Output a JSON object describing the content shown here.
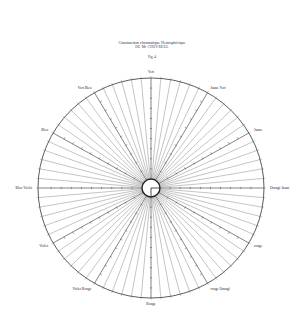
{
  "header": {
    "title": "Construction chromatique Hemisphérique",
    "subtitle": "DE Mr CHEVREUL",
    "figure": "Fig. 4"
  },
  "diagram": {
    "type": "chromatic-circle",
    "center": [
      151,
      188
    ],
    "radius_x": 113,
    "radius_y": 110,
    "inner_radius": 9,
    "ray_count": 72,
    "line_color": "#333333",
    "labels": [
      {
        "text": "Vert",
        "angle": 90
      },
      {
        "text": "Jaune Vert",
        "angle": 60
      },
      {
        "text": "Jaune",
        "angle": 30
      },
      {
        "text": "Orangé Jaune",
        "angle": 0
      },
      {
        "text": "rouge",
        "angle": -30
      },
      {
        "text": "rouge Orangé",
        "angle": -60
      },
      {
        "text": "Rouge",
        "angle": -90
      },
      {
        "text": "Violet Rouge",
        "angle": -120
      },
      {
        "text": "Violet",
        "angle": -150
      },
      {
        "text": "Bleu Violet",
        "angle": 180
      },
      {
        "text": "Bleu",
        "angle": 150
      },
      {
        "text": "Vert Bleu",
        "angle": 120
      }
    ]
  }
}
